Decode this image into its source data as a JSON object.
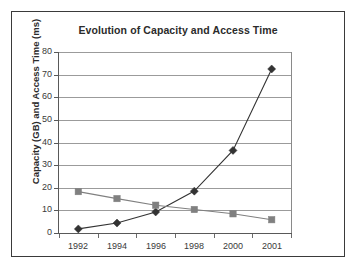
{
  "chart_data": {
    "type": "line",
    "title": "Evolution of Capacity and Access Time",
    "xlabel": "",
    "ylabel": "Capacity (GB) and Access Time (ms)",
    "categories": [
      "1992",
      "1994",
      "1996",
      "1998",
      "2000",
      "2001"
    ],
    "yticks": [
      "0",
      "10",
      "20",
      "30",
      "40",
      "50",
      "60",
      "70",
      "80"
    ],
    "ylim": [
      0,
      80
    ],
    "grid": "horizontal",
    "legend_position": "none",
    "series": [
      {
        "name": "Capacity (GB)",
        "marker": "diamond",
        "color": "#333333",
        "values": [
          1.8,
          4.4,
          9.3,
          18.5,
          36.5,
          72.5
        ]
      },
      {
        "name": "Access Time (ms)",
        "marker": "square",
        "color": "#808080",
        "values": [
          18.3,
          15.2,
          12.3,
          10.4,
          8.5,
          5.9
        ]
      }
    ]
  },
  "figure": {
    "border_color": "#3a3a3a",
    "background": "#ffffff",
    "gridline_color": "#9b9b9b",
    "axis_color": "#595959"
  }
}
